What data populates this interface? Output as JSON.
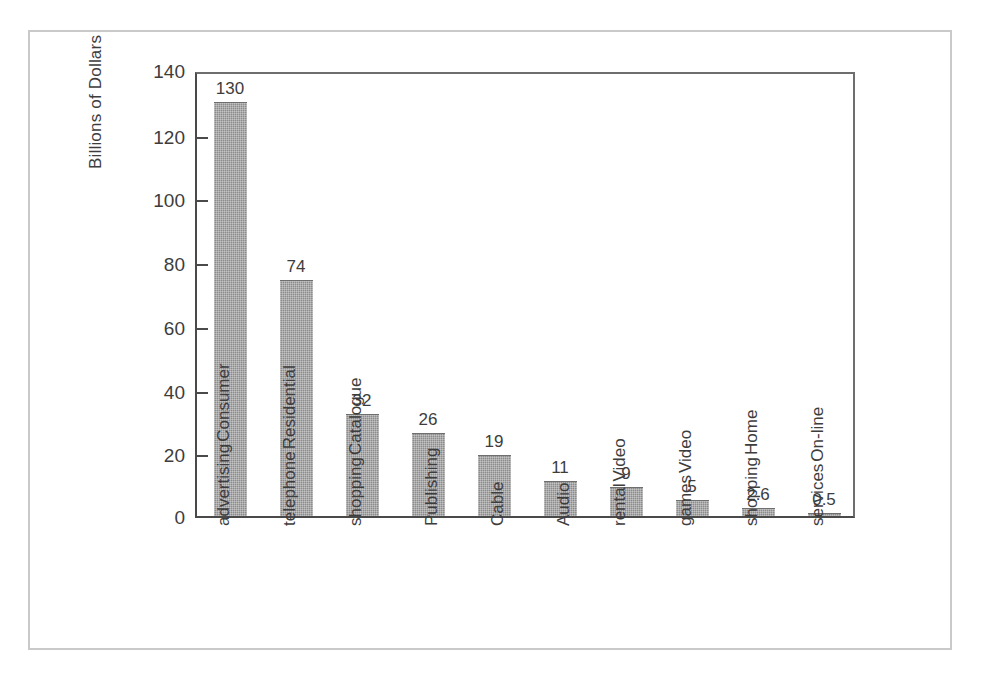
{
  "figure": {
    "frame_color": "#c9c9c9",
    "background": "#ffffff"
  },
  "chart_data": {
    "type": "bar",
    "title": "",
    "subtitle": "",
    "xlabel": "",
    "ylabel": "Billions of Dollars",
    "ylim": [
      0,
      140
    ],
    "yticks": [
      0,
      20,
      40,
      60,
      80,
      100,
      120,
      140
    ],
    "ytick_labels": [
      "0",
      "20",
      "40",
      "60",
      "80",
      "100",
      "120",
      "140"
    ],
    "grid": false,
    "legend": false,
    "bar_color": "#8b8b8b",
    "categories": [
      "Consumer advertising",
      "Residential telephone",
      "Catalogue shopping",
      "Publishing",
      "Cable",
      "Audio",
      "Video rental",
      "Video games",
      "Home shopping",
      "On-line services"
    ],
    "category_lines": [
      [
        "Consumer",
        "advertising"
      ],
      [
        "Residential",
        "telephone"
      ],
      [
        "Catalogue",
        "shopping"
      ],
      [
        "Publishing"
      ],
      [
        "Cable"
      ],
      [
        "Audio"
      ],
      [
        "Video",
        "rental"
      ],
      [
        "Video",
        "games"
      ],
      [
        "Home",
        "shopping"
      ],
      [
        "On-line",
        "services"
      ]
    ],
    "values": [
      130,
      74,
      32,
      26,
      19,
      11,
      9,
      5,
      2.6,
      0.5
    ],
    "value_labels": [
      "130",
      "74",
      "32",
      "26",
      "19",
      "11",
      "9",
      "5",
      "2.6",
      "0.5"
    ]
  }
}
